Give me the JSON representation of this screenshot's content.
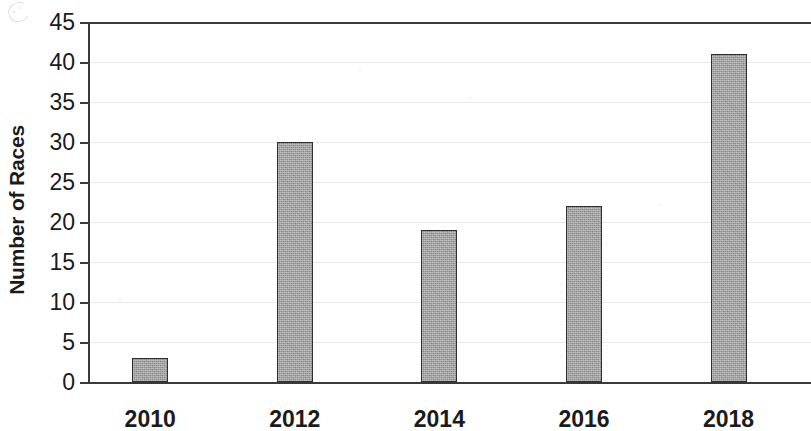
{
  "chart_data": {
    "type": "bar",
    "title": "",
    "xlabel": "",
    "ylabel": "Number of Races",
    "categories": [
      "2010",
      "2012",
      "2014",
      "2016",
      "2018"
    ],
    "values": [
      3,
      30,
      19,
      22,
      41
    ],
    "ylim": [
      0,
      45
    ],
    "yticks": [
      0,
      5,
      10,
      15,
      20,
      25,
      30,
      35,
      40,
      45
    ],
    "ytick_labels": [
      "0",
      "5",
      "10",
      "15",
      "20",
      "25",
      "30",
      "35",
      "40",
      "45"
    ],
    "grid": true,
    "legend": null,
    "bar_color": "#9c9c9c",
    "bar_edge_color": "#2f2f2f",
    "axis_color": "#3a3a3a"
  }
}
